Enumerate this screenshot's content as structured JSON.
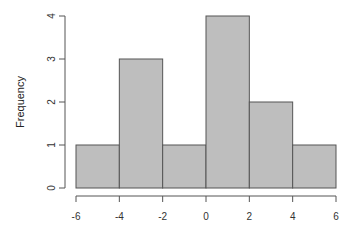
{
  "chart_data": {
    "type": "bar",
    "subtype": "histogram",
    "title": "",
    "xlabel": "",
    "ylabel": "Frequency",
    "bins": [
      {
        "start": -6,
        "end": -4,
        "count": 1
      },
      {
        "start": -4,
        "end": -2,
        "count": 3
      },
      {
        "start": -2,
        "end": 0,
        "count": 1
      },
      {
        "start": 0,
        "end": 2,
        "count": 4
      },
      {
        "start": 2,
        "end": 4,
        "count": 2
      },
      {
        "start": 4,
        "end": 6,
        "count": 1
      }
    ],
    "categories": [
      "[-6,-4)",
      "[-4,-2)",
      "[-2,0)",
      "[0,2)",
      "[2,4)",
      "[4,6]"
    ],
    "values": [
      1,
      3,
      1,
      4,
      2,
      1
    ],
    "xlim": [
      -6,
      6
    ],
    "ylim": [
      0,
      4
    ],
    "x_ticks": [
      "-6",
      "-4",
      "-2",
      "0",
      "2",
      "4",
      "6"
    ],
    "y_ticks": [
      "0",
      "1",
      "2",
      "3",
      "4"
    ],
    "grid": false,
    "legend": null,
    "colors": {
      "bar_fill": "#bebebe",
      "bar_stroke": "#555555",
      "axis": "#555555"
    }
  }
}
